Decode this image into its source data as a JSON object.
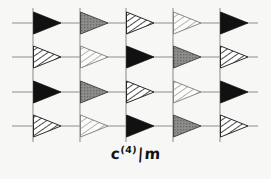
{
  "figure": {
    "background_color": "#f7f7f5",
    "width": 271,
    "height": 179
  },
  "caption": {
    "full_text": "c(4) | m",
    "base": "c",
    "superscript": "(4)",
    "separator": "|",
    "suffix": "m"
  },
  "grid": {
    "vertical_line_color": "#9a9a98",
    "horizontal_line_color": "#8e8e8c",
    "vertical_line_x": [
      33,
      80,
      126,
      173,
      220
    ],
    "horizontal_line_y": [
      23,
      57,
      92,
      126
    ],
    "vertical_line_top": 8,
    "vertical_line_bottom": 142,
    "horizontal_line_left": 12,
    "horizontal_line_right": 258,
    "columns": 5,
    "rows": 4
  },
  "legend": {
    "fill_styles": [
      {
        "key": "black",
        "label": "solid black",
        "color": "#111111"
      },
      {
        "key": "gray",
        "label": "solid gray",
        "color": "#8a8a8a"
      },
      {
        "key": "hatch",
        "label": "dense diagonal hatch",
        "color": "#2a2a2a"
      },
      {
        "key": "lighthatch",
        "label": "light diagonal hatch",
        "color": "#6f6f6f"
      }
    ]
  },
  "chart_data": {
    "type": "diagram",
    "columns": 5,
    "rows": 4,
    "arrow_direction": "right",
    "arrow_width": 28,
    "arrow_height": 22,
    "cells": [
      [
        "black",
        "gray",
        "hatch",
        "lighthatch",
        "black"
      ],
      [
        "hatch",
        "lighthatch",
        "black",
        "gray",
        "hatch"
      ],
      [
        "black",
        "gray",
        "hatch",
        "lighthatch",
        "black"
      ],
      [
        "hatch",
        "lighthatch",
        "black",
        "gray",
        "hatch"
      ]
    ]
  }
}
